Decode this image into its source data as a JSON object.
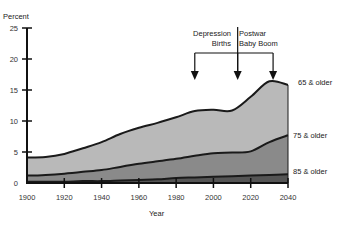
{
  "chart_data": {
    "type": "area",
    "title": "",
    "xlabel": "Year",
    "ylabel": "Percent",
    "xlim": [
      1900,
      2040
    ],
    "ylim": [
      0,
      25
    ],
    "x_ticks": [
      1900,
      1920,
      1940,
      1960,
      1980,
      2000,
      2020,
      2040
    ],
    "y_ticks": [
      0,
      5,
      10,
      15,
      20,
      25
    ],
    "grid": false,
    "stacked": false,
    "x": [
      1900,
      1910,
      1920,
      1930,
      1940,
      1950,
      1960,
      1970,
      1980,
      1990,
      2000,
      2010,
      2020,
      2030,
      2040
    ],
    "series": [
      {
        "name": "65 & older",
        "color": "#b9b9b9",
        "values": [
          4.1,
          4.2,
          4.7,
          5.6,
          6.6,
          7.9,
          8.9,
          9.7,
          10.6,
          11.6,
          11.8,
          11.7,
          13.9,
          16.4,
          15.8
        ]
      },
      {
        "name": "75 & older",
        "color": "#8a8a8a",
        "values": [
          1.2,
          1.3,
          1.5,
          1.8,
          2.1,
          2.6,
          3.1,
          3.5,
          3.9,
          4.4,
          4.8,
          4.9,
          5.1,
          6.6,
          7.7
        ]
      },
      {
        "name": "85 & older",
        "color": "#555555",
        "values": [
          0.2,
          0.2,
          0.2,
          0.3,
          0.3,
          0.4,
          0.5,
          0.6,
          0.8,
          0.9,
          1.0,
          1.1,
          1.2,
          1.3,
          1.4
        ]
      }
    ],
    "annotations": [
      {
        "text_lines": [
          "Depression",
          "Births"
        ],
        "align": "right"
      },
      {
        "text_lines": [
          "Postwar",
          "Baby Boom"
        ],
        "align": "left"
      }
    ],
    "arrow_years": [
      1990,
      2013,
      2032
    ]
  },
  "labels": {
    "ylabel": "Percent",
    "xlabel": "Year",
    "series_65": "65 & older",
    "series_75": "75 & older",
    "series_85": "85 & older",
    "depression_1": "Depression",
    "depression_2": "Births",
    "postwar_1": "Postwar",
    "postwar_2": "Baby Boom"
  }
}
